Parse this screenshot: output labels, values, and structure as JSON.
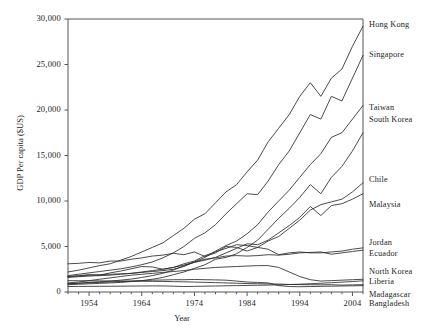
{
  "chart_data": {
    "type": "line",
    "title": "",
    "xlabel": "Year",
    "ylabel": "GDP Per capita ($US)",
    "xlim": [
      1950,
      2006
    ],
    "ylim": [
      0,
      30000
    ],
    "grid": false,
    "legend_position": "right-inline-labels",
    "xticks": [
      "1954",
      "1964",
      "1974",
      "1984",
      "1994",
      "2004"
    ],
    "xtick_values": [
      1954,
      1964,
      1974,
      1984,
      1994,
      2004
    ],
    "yticks": [
      "0",
      "5,000",
      "10,000",
      "15,000",
      "20,000",
      "25,000",
      "30,000"
    ],
    "ytick_values": [
      0,
      5000,
      10000,
      15000,
      20000,
      25000,
      30000
    ],
    "x": [
      1950,
      1952,
      1954,
      1956,
      1958,
      1960,
      1962,
      1964,
      1966,
      1968,
      1970,
      1972,
      1974,
      1976,
      1978,
      1980,
      1982,
      1984,
      1986,
      1988,
      1990,
      1992,
      1994,
      1996,
      1998,
      2000,
      2002,
      2004,
      2006
    ],
    "series": [
      {
        "name": "Hong Kong",
        "label": "Hong Kong",
        "values": [
          2200,
          2400,
          2650,
          2900,
          3100,
          3500,
          3900,
          4400,
          4900,
          5400,
          6200,
          7000,
          8000,
          8600,
          9800,
          11000,
          11800,
          13200,
          14500,
          16500,
          18000,
          19500,
          21500,
          23000,
          21500,
          23500,
          24500,
          27000,
          29200
        ]
      },
      {
        "name": "Singapore",
        "label": "Singapore",
        "values": [
          1800,
          1950,
          2100,
          2250,
          2400,
          2550,
          2750,
          3000,
          3300,
          3750,
          4300,
          5000,
          5900,
          6500,
          7400,
          8600,
          9700,
          10800,
          10700,
          12200,
          14000,
          15500,
          17500,
          19500,
          19000,
          21500,
          21000,
          23500,
          26000
        ]
      },
      {
        "name": "Taiwan",
        "label": "Taiwan",
        "values": [
          900,
          980,
          1050,
          1120,
          1200,
          1300,
          1420,
          1600,
          1800,
          2050,
          2400,
          2900,
          3300,
          3800,
          4500,
          5100,
          5600,
          6400,
          7400,
          8800,
          10000,
          11200,
          12600,
          14000,
          15200,
          17000,
          17500,
          19000,
          20500
        ]
      },
      {
        "name": "South Korea",
        "label": "South Korea",
        "values": [
          800,
          850,
          900,
          950,
          1000,
          1050,
          1150,
          1250,
          1400,
          1600,
          1900,
          2200,
          2600,
          3000,
          3600,
          3800,
          4200,
          4900,
          5700,
          6900,
          8100,
          9200,
          10400,
          11800,
          10800,
          12600,
          13800,
          15500,
          17500
        ]
      },
      {
        "name": "Chile",
        "label": "Chile",
        "values": [
          3100,
          3150,
          3250,
          3200,
          3400,
          3400,
          3600,
          3750,
          3950,
          4050,
          4250,
          4100,
          4400,
          3900,
          4300,
          5000,
          4900,
          4500,
          4900,
          5600,
          6100,
          7000,
          7900,
          9000,
          9600,
          9900,
          10200,
          11000,
          12000
        ]
      },
      {
        "name": "Malaysia",
        "label": "Malaysia",
        "values": [
          1600,
          1680,
          1750,
          1800,
          1850,
          1950,
          2050,
          2200,
          2350,
          2500,
          2700,
          2950,
          3250,
          3500,
          3800,
          4300,
          4800,
          5300,
          5200,
          5700,
          6500,
          7300,
          8200,
          9400,
          8400,
          9500,
          9700,
          10200,
          10800
        ]
      },
      {
        "name": "Jordan",
        "label": "Jordan",
        "values": [
          1700,
          1800,
          1900,
          1850,
          2100,
          2300,
          2550,
          2800,
          2750,
          2500,
          2700,
          3100,
          3400,
          4000,
          4400,
          4800,
          5200,
          5100,
          4900,
          4700,
          4100,
          4300,
          4400,
          4300,
          4300,
          4400,
          4500,
          4700,
          4850
        ]
      },
      {
        "name": "Ecuador",
        "label": "Ecuador",
        "values": [
          1700,
          1750,
          1850,
          1900,
          1950,
          2000,
          2050,
          2150,
          2250,
          2350,
          2500,
          2800,
          3300,
          3600,
          3750,
          3950,
          4000,
          3950,
          4000,
          4100,
          4050,
          4150,
          4300,
          4350,
          4400,
          4150,
          4300,
          4450,
          4600
        ]
      },
      {
        "name": "North Korea",
        "label": "North Korea",
        "values": [
          1000,
          1100,
          1250,
          1400,
          1550,
          1700,
          1850,
          1950,
          2050,
          2150,
          2250,
          2350,
          2500,
          2600,
          2700,
          2750,
          2800,
          2850,
          2900,
          2900,
          2700,
          2200,
          1700,
          1350,
          1200,
          1250,
          1300,
          1350,
          1400
        ]
      },
      {
        "name": "Liberia",
        "label": "Liberia",
        "values": [
          900,
          950,
          1000,
          1050,
          1100,
          1150,
          1200,
          1250,
          1300,
          1320,
          1350,
          1350,
          1380,
          1350,
          1330,
          1300,
          1200,
          1100,
          1050,
          1000,
          700,
          600,
          580,
          600,
          620,
          640,
          660,
          680,
          700
        ]
      },
      {
        "name": "Madagascar",
        "label": "Madagascar",
        "values": [
          1250,
          1240,
          1230,
          1220,
          1210,
          1200,
          1190,
          1180,
          1170,
          1160,
          1140,
          1120,
          1090,
          1060,
          1030,
          1000,
          960,
          930,
          910,
          890,
          870,
          830,
          810,
          800,
          790,
          800,
          760,
          780,
          800
        ]
      },
      {
        "name": "Bangladesh",
        "label": "Bangladesh",
        "values": [
          600,
          610,
          620,
          625,
          630,
          640,
          650,
          660,
          670,
          665,
          640,
          600,
          620,
          640,
          660,
          680,
          700,
          720,
          740,
          760,
          790,
          820,
          860,
          910,
          960,
          1020,
          1080,
          1150,
          1230
        ]
      }
    ]
  },
  "series_labels": [
    {
      "name": "Hong Kong",
      "top": 20
    },
    {
      "name": "Singapore",
      "top": 50
    },
    {
      "name": "Taiwan",
      "top": 103
    },
    {
      "name": "South Korea",
      "top": 115
    },
    {
      "name": "Chile",
      "top": 175
    },
    {
      "name": "Malaysia",
      "top": 200
    },
    {
      "name": "Jordan",
      "top": 238
    },
    {
      "name": "Ecuador",
      "top": 249
    },
    {
      "name": "North Korea",
      "top": 267
    },
    {
      "name": "Liberia",
      "top": 277
    },
    {
      "name": "Madagascar",
      "top": 290
    },
    {
      "name": "Bangladesh",
      "top": 299
    }
  ],
  "colors": {
    "line": "#2b2b2b",
    "axis": "#555555",
    "background": "#ffffff",
    "text": "#1d1d1d"
  }
}
